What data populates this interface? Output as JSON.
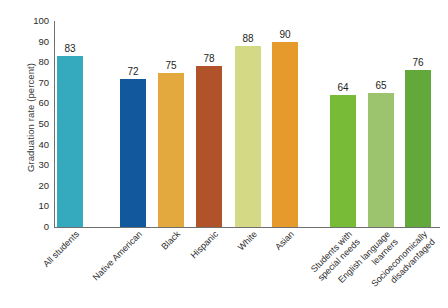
{
  "chart_data": {
    "type": "bar",
    "title": "",
    "xlabel": "",
    "ylabel": "Graduation rate (percent)",
    "ylim": [
      0,
      100
    ],
    "ytick_step": 10,
    "yticks": [
      100,
      90,
      80,
      70,
      60,
      50,
      40,
      30,
      20,
      10,
      0
    ],
    "grid": false,
    "legend": "none",
    "categories": [
      "All students",
      "Native American",
      "Black",
      "Hispanic",
      "White",
      "Asian",
      "Students with special needs",
      "English language learners",
      "Socioeconomically disadvantaged"
    ],
    "values": [
      83,
      72,
      75,
      78,
      88,
      90,
      64,
      65,
      76
    ],
    "bars": [
      {
        "label_line1": "All students",
        "label_line2": "",
        "value": 83,
        "value_text": "83",
        "color": "#35A9BE",
        "x": 3,
        "width": 26
      },
      {
        "label_line1": "Native American",
        "label_line2": "",
        "value": 72,
        "value_text": "72",
        "color": "#11599C",
        "x": 66,
        "width": 26
      },
      {
        "label_line1": "Black",
        "label_line2": "",
        "value": 75,
        "value_text": "75",
        "color": "#E3A83E",
        "x": 104,
        "width": 26
      },
      {
        "label_line1": "Hispanic",
        "label_line2": "",
        "value": 78,
        "value_text": "78",
        "color": "#B0522A",
        "x": 142,
        "width": 26
      },
      {
        "label_line1": "White",
        "label_line2": "",
        "value": 88,
        "value_text": "88",
        "color": "#D4D986",
        "x": 181,
        "width": 26
      },
      {
        "label_line1": "Asian",
        "label_line2": "",
        "value": 90,
        "value_text": "90",
        "color": "#E69A2C",
        "x": 218,
        "width": 26
      },
      {
        "label_line1": "Students with",
        "label_line2": "special needs",
        "value": 64,
        "value_text": "64",
        "color": "#78BB36",
        "x": 276,
        "width": 26
      },
      {
        "label_line1": "English language",
        "label_line2": "learners",
        "value": 65,
        "value_text": "65",
        "color": "#9CC46E",
        "x": 314,
        "width": 26
      },
      {
        "label_line1": "Socioeconomically",
        "label_line2": "disadvantaged",
        "value": 76,
        "value_text": "76",
        "color": "#62A83A",
        "x": 351,
        "width": 26
      }
    ],
    "axis_color": "#6f6f6f"
  }
}
